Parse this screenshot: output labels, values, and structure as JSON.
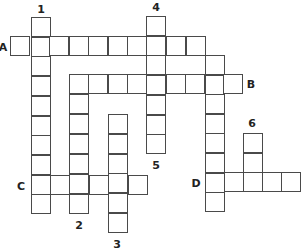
{
  "puzzle": {
    "type": "crossword",
    "cell_size": 20,
    "colors": {
      "border": "#4a4a4a",
      "cell_fill": "#ffffff",
      "label": "#222222"
    },
    "entries": [
      {
        "id": "1",
        "direction": "down",
        "x": 31,
        "y": 17,
        "length": 10,
        "pitch": 19.7
      },
      {
        "id": "2",
        "direction": "down",
        "x": 69,
        "y": 74,
        "length": 7,
        "pitch": 20
      },
      {
        "id": "3",
        "direction": "down",
        "x": 108,
        "y": 114,
        "length": 6,
        "pitch": 19.8
      },
      {
        "id": "4",
        "direction": "down",
        "x": 146,
        "y": 16,
        "length": 7,
        "pitch": 19.7
      },
      {
        "id": "5",
        "direction": "down",
        "x": 205,
        "y": 55,
        "length": 8,
        "pitch": 19.6
      },
      {
        "id": "6",
        "direction": "down",
        "x": 243,
        "y": 133,
        "length": 3,
        "pitch": 19.6
      },
      {
        "id": "A",
        "direction": "across",
        "x": 10,
        "y": 36,
        "length": 10,
        "pitch": 19.5
      },
      {
        "id": "B",
        "direction": "across",
        "x": 69,
        "y": 74,
        "length": 9,
        "pitch": 19.3
      },
      {
        "id": "C",
        "direction": "across",
        "x": 31,
        "y": 175,
        "length": 6,
        "pitch": 19.3
      },
      {
        "id": "D",
        "direction": "across",
        "x": 205,
        "y": 172,
        "length": 5,
        "pitch": 18.9
      }
    ],
    "labels": [
      {
        "text": "1",
        "x": 41,
        "y": 9
      },
      {
        "text": "4",
        "x": 156,
        "y": 7
      },
      {
        "text": "A",
        "x": 3,
        "y": 47
      },
      {
        "text": "B",
        "x": 251,
        "y": 84
      },
      {
        "text": "6",
        "x": 252,
        "y": 123
      },
      {
        "text": "5",
        "x": 156,
        "y": 165
      },
      {
        "text": "C",
        "x": 21,
        "y": 186
      },
      {
        "text": "D",
        "x": 196,
        "y": 183
      },
      {
        "text": "2",
        "x": 79,
        "y": 225
      },
      {
        "text": "3",
        "x": 117,
        "y": 244
      }
    ]
  }
}
